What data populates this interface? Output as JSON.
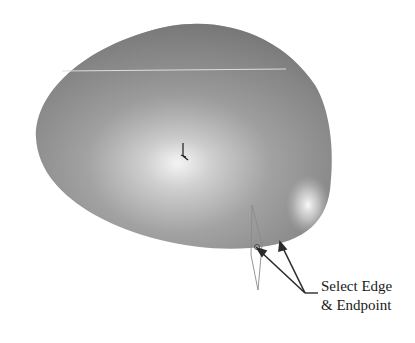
{
  "figure": {
    "colors": {
      "background": "#ffffff",
      "surface_dark": "#7a7a7a",
      "surface_mid": "#a9a9a9",
      "surface_highlight": "#f2f2f2",
      "edge_line": "#d8d8d8",
      "plane_outline": "#8a8a8a",
      "arrow": "#2b2b2b"
    }
  },
  "callout": {
    "line1": "Select Edge",
    "line2": "& Endpoint"
  }
}
